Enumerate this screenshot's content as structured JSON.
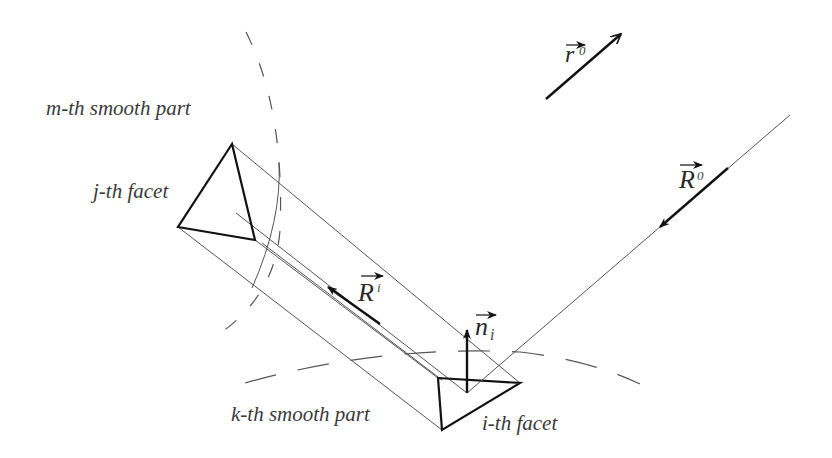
{
  "diagram": {
    "labels": {
      "m_smooth_part": "m-th smooth part",
      "j_facet": "j-th facet",
      "k_smooth_part": "k-th smooth part",
      "i_facet": "i-th facet"
    },
    "vectors": {
      "r0": {
        "base": "r",
        "superscript": "0"
      },
      "R0": {
        "base": "R",
        "superscript": "0"
      },
      "Ri": {
        "base": "R",
        "superscript": "i"
      },
      "ni": {
        "base": "n",
        "subscript": "i"
      }
    },
    "colors": {
      "thick_line": "#111111",
      "thin_line": "#555555",
      "dashed_arc": "#555555",
      "text": "#3a3a3a"
    }
  }
}
